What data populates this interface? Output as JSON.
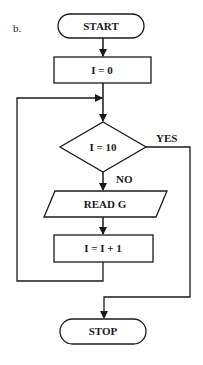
{
  "diagram": {
    "label": "b.",
    "nodes": {
      "start": {
        "type": "terminator",
        "text": "START"
      },
      "init": {
        "type": "process",
        "text": "I = 0"
      },
      "decision": {
        "type": "decision",
        "text": "I = 10"
      },
      "read": {
        "type": "input-output",
        "text": "READ G"
      },
      "increment": {
        "type": "process",
        "text": "I = I + 1"
      },
      "stop": {
        "type": "terminator",
        "text": "STOP"
      }
    },
    "edges": {
      "yes_label": "YES",
      "no_label": "NO"
    },
    "colors": {
      "stroke": "#1a1a1a",
      "background": "#ffffff"
    }
  }
}
